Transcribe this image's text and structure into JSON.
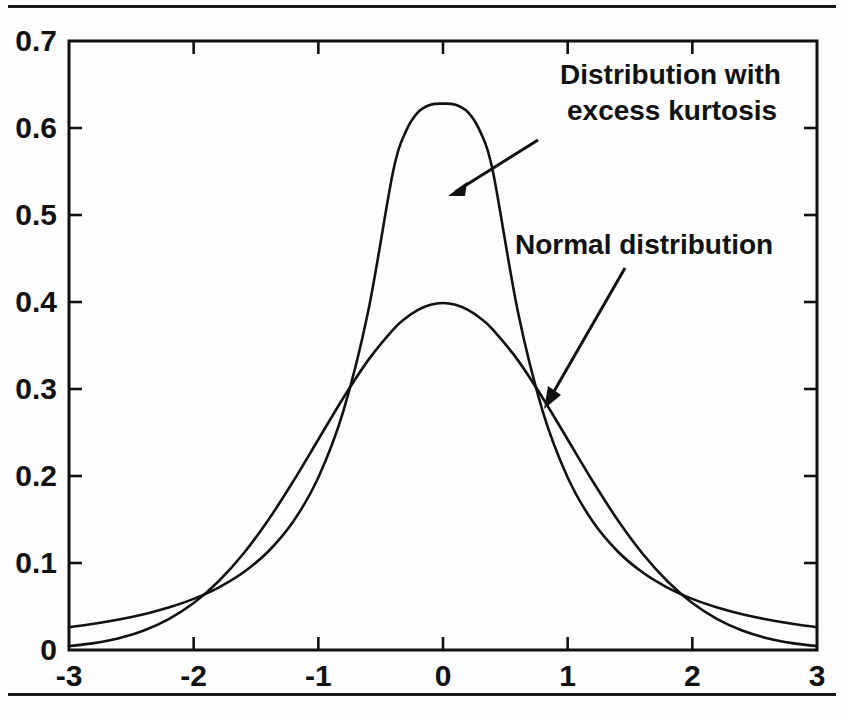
{
  "figure": {
    "background_color": "#fdfdfd",
    "ink_color": "#111111",
    "top_rule": "horizontal-rule",
    "bottom_rule": "horizontal-rule"
  },
  "chart_data": {
    "type": "line",
    "title": "",
    "subtitle": "",
    "xlabel": "",
    "ylabel": "",
    "xlim": [
      -3,
      3
    ],
    "ylim": [
      0,
      0.7
    ],
    "grid": false,
    "legend": "none (inline annotations with leader arrows)",
    "xticks": [
      -3,
      -2,
      -1,
      0,
      1,
      2,
      3
    ],
    "xtick_labels": [
      "-3",
      "-2",
      "-1",
      "0",
      "1",
      "2",
      "3"
    ],
    "yticks": [
      0,
      0.1,
      0.2,
      0.3,
      0.4,
      0.5,
      0.6,
      0.7
    ],
    "ytick_labels": [
      "0",
      "0.1",
      "0.2",
      "0.3",
      "0.4",
      "0.5",
      "0.6",
      "0.7"
    ],
    "x": [
      -3,
      -2.8,
      -2.6,
      -2.4,
      -2.2,
      -2,
      -1.8,
      -1.6,
      -1.4,
      -1.2,
      -1,
      -0.8,
      -0.6,
      -0.4,
      -0.3,
      -0.2,
      -0.1,
      0,
      0.1,
      0.2,
      0.3,
      0.4,
      0.6,
      0.8,
      1,
      1.2,
      1.4,
      1.6,
      1.8,
      2,
      2.2,
      2.4,
      2.6,
      2.8,
      3
    ],
    "series": [
      {
        "name": "Normal distribution",
        "values": [
          0.0044,
          0.0079,
          0.0136,
          0.0224,
          0.0355,
          0.054,
          0.079,
          0.1109,
          0.1497,
          0.1942,
          0.242,
          0.2897,
          0.3332,
          0.3683,
          0.3814,
          0.391,
          0.3969,
          0.3989,
          0.3969,
          0.391,
          0.3814,
          0.3683,
          0.3332,
          0.2897,
          0.242,
          0.1942,
          0.1497,
          0.1109,
          0.079,
          0.054,
          0.0355,
          0.0224,
          0.0136,
          0.0079,
          0.0044
        ],
        "peak": {
          "x": 0,
          "y": 0.399
        }
      },
      {
        "name": "Distribution with excess kurtosis",
        "values": [
          0.0262,
          0.0302,
          0.0351,
          0.0412,
          0.0489,
          0.0588,
          0.0718,
          0.0893,
          0.1135,
          0.1479,
          0.1983,
          0.2743,
          0.3893,
          0.5502,
          0.5953,
          0.6182,
          0.6267,
          0.628,
          0.6267,
          0.6182,
          0.5953,
          0.5502,
          0.3893,
          0.2743,
          0.1983,
          0.1479,
          0.1135,
          0.0893,
          0.0718,
          0.0588,
          0.0489,
          0.0412,
          0.0351,
          0.0302,
          0.0262
        ],
        "peak": {
          "x": 0,
          "y": 0.628
        }
      }
    ],
    "crossings": [
      {
        "x": -2.2,
        "y": 0.048
      },
      {
        "x": 2.2,
        "y": 0.048
      }
    ],
    "annotations": [
      {
        "id": "annotation-excess-kurtosis",
        "lines": [
          "Distribution with",
          "excess kurtosis"
        ],
        "text": "Distribution with excess kurtosis",
        "points_to": {
          "x": 0.05,
          "y": 0.52
        }
      },
      {
        "id": "annotation-normal-distribution",
        "lines": [
          "Normal distribution"
        ],
        "text": "Normal distribution",
        "points_to": {
          "x": 0.78,
          "y": 0.285
        }
      }
    ]
  }
}
